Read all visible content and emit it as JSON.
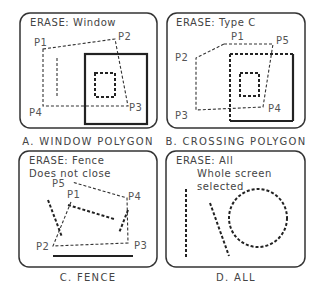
{
  "figure": "AutoCAD ERASE selection methods",
  "panels": [
    {
      "id": "A",
      "prompt": "ERASE: Window",
      "extra_lines": [],
      "points": [
        "P1",
        "P2",
        "P3",
        "P4"
      ],
      "caption": "A. WINDOW POLYGON"
    },
    {
      "id": "B",
      "prompt": "ERASE: Type C",
      "extra_lines": [],
      "points": [
        "P1",
        "P2",
        "P3",
        "P4",
        "P5"
      ],
      "caption": "B. CROSSING POLYGON"
    },
    {
      "id": "C",
      "prompt": "ERASE: Fence",
      "extra_lines": [
        "Does not close"
      ],
      "points": [
        "P1",
        "P2",
        "P3",
        "P4",
        "P5"
      ],
      "caption": "C. FENCE"
    },
    {
      "id": "D",
      "prompt": "ERASE: All",
      "extra_lines": [
        "Whole screen",
        "selected"
      ],
      "points": [],
      "caption": "D. ALL"
    }
  ],
  "colors": {
    "line": "#222222",
    "text": "#444444",
    "background": "#ffffff"
  }
}
